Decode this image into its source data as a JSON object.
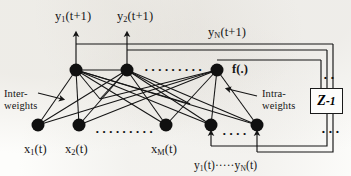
{
  "figure": {
    "type": "neural-network-diagram",
    "stroke_color": "#141414",
    "node_color": "#101010",
    "background": "#fdfdfb"
  },
  "labels": {
    "output_1": "y₁(t+1)",
    "output_2": "y₂(t+1)",
    "output_n": "yN(t+1)",
    "activation": "f(.)",
    "inter_weights": "Inter-\nweights",
    "inter_weights_line1": "Inter-",
    "inter_weights_line2": "weights",
    "intra_weights_line1": "Intra-",
    "intra_weights_line2": "weights",
    "delay_block": "Z",
    "delay_block_exponent": "-1",
    "input_1": "x₁(t)",
    "input_2": "x₂(t)",
    "input_m": "xM(t)",
    "feedback_inputs": "y₁(t)·····yN(t)"
  },
  "ellipses": {
    "hidden_layer_gap": "• • • • • • • • •",
    "input_layer_gap": "• • • • • • • • •",
    "feedback_gap": "• • • •",
    "delay_top_dots": "• •",
    "delay_bottom_dots": "• • •"
  },
  "nodes": {
    "output_layer": [
      {
        "id": "o1",
        "cx": 76,
        "cy": 70,
        "r": 6.5
      },
      {
        "id": "o2",
        "cx": 127,
        "cy": 70,
        "r": 6.5
      },
      {
        "id": "oN",
        "cx": 217,
        "cy": 70,
        "r": 6.5
      }
    ],
    "input_layer": [
      {
        "id": "x1",
        "cx": 38,
        "cy": 125,
        "r": 6.5
      },
      {
        "id": "x2",
        "cx": 79,
        "cy": 125,
        "r": 6.5
      },
      {
        "id": "xM",
        "cx": 166,
        "cy": 125,
        "r": 6.5
      },
      {
        "id": "yf1",
        "cx": 211,
        "cy": 125,
        "r": 6.5
      },
      {
        "id": "yfN",
        "cx": 257,
        "cy": 125,
        "r": 6.5
      }
    ]
  },
  "connections": {
    "inter_layer_fully_connected": true,
    "intra_layer_recurrent": true,
    "feedback_delay_loop": true
  }
}
